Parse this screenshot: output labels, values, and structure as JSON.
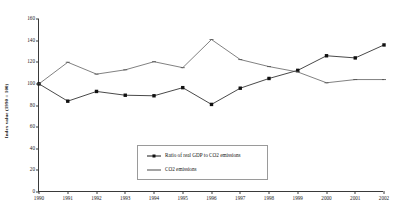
{
  "chart_data": {
    "type": "line",
    "title": "",
    "xlabel": "",
    "ylabel": "Index value (1990 = 100)",
    "categories": [
      "1990",
      "1991",
      "1992",
      "1993",
      "1994",
      "1995",
      "1996",
      "1997",
      "1998",
      "1999",
      "2000",
      "2001",
      "2002"
    ],
    "ylim": [
      0,
      160
    ],
    "ytick_step": 20,
    "yticks": [
      0,
      20,
      40,
      60,
      80,
      100,
      120,
      140,
      160
    ],
    "grid": false,
    "legend_position": "center",
    "series": [
      {
        "name": "Ratio of real GDP to CO2 emissions",
        "marker": "filled-square",
        "values": [
          100,
          84,
          93,
          89.5,
          89,
          96.5,
          81,
          96,
          105,
          112.5,
          126,
          124,
          136
        ]
      },
      {
        "name": "CO2 emissions",
        "marker": "dash",
        "values": [
          100,
          120,
          109,
          113,
          120.5,
          115,
          141,
          122.5,
          116,
          111,
          101,
          104,
          104
        ]
      }
    ]
  },
  "axes": {
    "y_title": "Index value (1990 = 100)"
  },
  "legend": {
    "items": [
      {
        "label": "Ratio of real GDP to CO2 emissions"
      },
      {
        "label": "CO2 emissions"
      }
    ]
  }
}
